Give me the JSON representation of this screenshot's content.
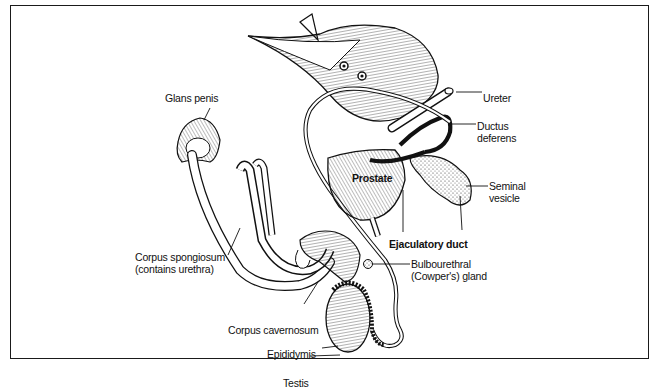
{
  "diagram": {
    "labels": {
      "glans_penis": "Glans penis",
      "ureter": "Ureter",
      "ductus_deferens": "Ductus\ndeferens",
      "prostate": "Prostate",
      "seminal_vesicle": "Seminal\nvesicle",
      "ejaculatory_duct": "Ejaculatory duct",
      "corpus_spongiosum": "Corpus spongiosum\n(contains urethra)",
      "bulbourethral_gland": "Bulbourethral\n(Cowper's) gland",
      "corpus_cavernosum": "Corpus cavernosum",
      "epididymis": "Epididymis",
      "testis": "Testis"
    },
    "colors": {
      "ink": "#111111",
      "background": "#ffffff",
      "frame": "#1a1a1a"
    }
  }
}
